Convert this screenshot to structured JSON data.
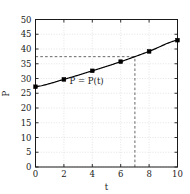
{
  "chart_data": {
    "type": "line",
    "title": "",
    "xlabel": "t",
    "ylabel": "P",
    "xlim": [
      0,
      10
    ],
    "ylim": [
      0,
      50
    ],
    "grid": true,
    "legend": false,
    "x": [
      0,
      2,
      4,
      6,
      8,
      10
    ],
    "series": [
      {
        "name": "P = P(t)",
        "values": [
          27.2,
          29.7,
          32.6,
          35.7,
          39.2,
          43.0
        ],
        "marker": "square",
        "color": "#000000"
      }
    ],
    "xticks": [
      "0",
      "2",
      "4",
      "6",
      "8",
      "10"
    ],
    "xtick_values": [
      0,
      2,
      4,
      6,
      8,
      10
    ],
    "yticks": [
      "0",
      "5",
      "10",
      "15",
      "20",
      "25",
      "30",
      "35",
      "40",
      "45",
      "50"
    ],
    "ytick_values": [
      0,
      5,
      10,
      15,
      20,
      25,
      30,
      35,
      40,
      45,
      50
    ],
    "annotations": [
      {
        "name": "curve-label",
        "text": "P = P(t)",
        "x": 3.6,
        "y": 28.2
      }
    ],
    "reference_lines": [
      {
        "name": "horizontal-guide",
        "orientation": "horizontal",
        "value": 37.4,
        "from": 0,
        "to": 7,
        "style": "dashed"
      },
      {
        "name": "vertical-guide",
        "orientation": "vertical",
        "value": 7,
        "from": 0,
        "to": 37.4,
        "style": "dashed"
      }
    ],
    "colors": {
      "line": "#000000",
      "marker": "#000000",
      "grid": "#d9d9d9",
      "axis": "#1a1a1a",
      "guide": "#555555",
      "background": "#ffffff"
    }
  }
}
